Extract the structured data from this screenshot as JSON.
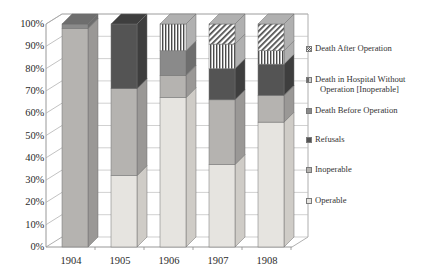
{
  "chart_data": {
    "type": "bar",
    "subtype": "stacked-percentage-column-3d",
    "title": "",
    "xlabel": "",
    "ylabel": "",
    "ylim": [
      0,
      100
    ],
    "yticks": [
      "0%",
      "10%",
      "20%",
      "30%",
      "40%",
      "50%",
      "60%",
      "70%",
      "80%",
      "90%",
      "100%"
    ],
    "ytick_values": [
      0,
      10,
      20,
      30,
      40,
      50,
      60,
      70,
      80,
      90,
      100
    ],
    "grid": true,
    "legend_position": "right",
    "categories": [
      "1904",
      "1905",
      "1906",
      "1907",
      "1908"
    ],
    "series": [
      {
        "name": "Operable",
        "pattern": "solid",
        "color": "#e6e4e0",
        "side_color": "#cfccc7",
        "values": [
          0,
          32,
          67,
          37,
          56
        ]
      },
      {
        "name": "Inoperable",
        "pattern": "solid",
        "color": "#b5b3b0",
        "side_color": "#9a9896",
        "values": [
          98,
          39,
          10,
          29,
          12
        ]
      },
      {
        "name": "Refusals",
        "pattern": "solid",
        "color": "#545454",
        "side_color": "#3e3e3e",
        "values": [
          0,
          29,
          0,
          14,
          14
        ]
      },
      {
        "name": "Death Before Operation",
        "pattern": "solid",
        "color": "#8a8a8a",
        "side_color": "#6e6e6e",
        "values": [
          2,
          0,
          11,
          0,
          0
        ]
      },
      {
        "name": "Death in Hospital Without Operation [Inoperable]",
        "pattern": "vertical-stripes",
        "color": "#ffffff",
        "stripe_color": "#4a4a4a",
        "side_color": "#b0b0b0",
        "values": [
          0,
          0,
          12,
          11,
          6
        ]
      },
      {
        "name": "Death After Operation",
        "pattern": "diagonal-stripes",
        "color": "#ffffff",
        "stripe_color": "#4a4a4a",
        "side_color": "#b0b0b0",
        "values": [
          0,
          0,
          0,
          9,
          12
        ]
      }
    ]
  },
  "legend": {
    "items": [
      {
        "label": "Death After Operation",
        "label_line1": "Death After Operation",
        "label_line2": "",
        "swatch": "diagonal-stripes-swatch"
      },
      {
        "label": "Death in Hospital Without Operation [Inoperable]",
        "label_line1": "Death in Hospital Without",
        "label_line2": "Operation [Inoperable]",
        "swatch": "vertical-stripes-swatch"
      },
      {
        "label": "Death Before Operation",
        "label_line1": "Death Before Operation",
        "label_line2": "",
        "swatch": "medium-dark-gray-swatch"
      },
      {
        "label": "Refusals",
        "label_line1": "Refusals",
        "label_line2": "",
        "swatch": "dark-gray-swatch"
      },
      {
        "label": "Inoperable",
        "label_line1": "Inoperable",
        "label_line2": "",
        "swatch": "medium-gray-swatch"
      },
      {
        "label": "Operable",
        "label_line1": "Operable",
        "label_line2": "",
        "swatch": "light-gray-swatch"
      }
    ]
  },
  "colors": {
    "operable": "#e6e4e0",
    "inoperable": "#b5b3b0",
    "refusals": "#545454",
    "death_before_operation": "#8a8a8a",
    "stripe": "#4a4a4a",
    "axis": "#8d8d8d",
    "text": "#2b2b2b"
  }
}
